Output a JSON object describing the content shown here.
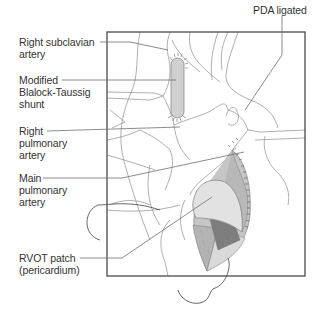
{
  "figure": {
    "colors": {
      "line": "#8a8a8a",
      "frame": "#4a4a4a",
      "leader": "#6f6f6f",
      "shunt_fill": "#d0d0d0",
      "patch_light": "#e2e2e2",
      "patch_mid": "#b8b8b8",
      "patch_dark": "#7d7d7d",
      "tissue": "#c6c6c6",
      "text": "#333333"
    }
  },
  "labels": [
    {
      "id": "right-subclavian-artery",
      "text": "Right subclavian\nartery"
    },
    {
      "id": "modified-bt-shunt",
      "text": "Modified\nBlalock-Taussig\nshunt"
    },
    {
      "id": "right-pulmonary-artery",
      "text": "Right\npulmonary\nartery"
    },
    {
      "id": "main-pulmonary-artery",
      "text": "Main\npulmonary\nartery"
    },
    {
      "id": "rvot-patch",
      "text": "RVOT patch\n(pericardium)"
    },
    {
      "id": "pda-ligated",
      "text": "PDA ligated"
    }
  ]
}
